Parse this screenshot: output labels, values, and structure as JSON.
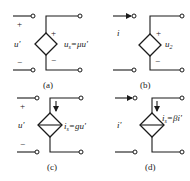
{
  "diagram": {
    "panels": [
      {
        "id": "a",
        "caption": "(a)",
        "type": "VCVS",
        "input_label": "u'",
        "input_plus": "+",
        "input_minus": "−",
        "source_plus": "+",
        "source_minus": "−",
        "output_label": "u",
        "output_sub": "s",
        "output_expr": "=μu'"
      },
      {
        "id": "b",
        "caption": "(b)",
        "type": "CCVS",
        "input_label": "i",
        "source_plus": "+",
        "source_minus": "−",
        "output_label": "u",
        "output_sub": "2"
      },
      {
        "id": "c",
        "caption": "(c)",
        "type": "VCCS",
        "input_label": "u'",
        "input_plus": "+",
        "input_minus": "−",
        "output_label": "i",
        "output_sub": "s",
        "output_expr": "=gu'"
      },
      {
        "id": "d",
        "caption": "(d)",
        "type": "CCCS",
        "input_label": "i'",
        "output_label": "i",
        "output_sub": "s",
        "output_expr": "=βi'"
      }
    ]
  },
  "colors": {
    "line": "#1a1a1a",
    "background": "#ffffff"
  }
}
